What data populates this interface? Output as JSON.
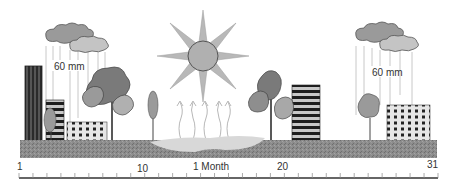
{
  "diagram": {
    "rain_left": {
      "label": "60 mm"
    },
    "rain_right": {
      "label": "60 mm"
    },
    "timeline": {
      "start_label": "1",
      "tick_10_label": "10",
      "center_label": "1 Month",
      "tick_20_label": "20",
      "end_label": "31",
      "start_day": 1,
      "end_day": 31
    },
    "colors": {
      "ground": "#8a8a8a",
      "sun": "#b0b0b0",
      "cloud_dark": "#9a9a9a",
      "cloud_light": "#c4c4c4",
      "tree_dark": "#7a7a7a",
      "tree_light": "#a8a8a8",
      "water": "#d8d8d8",
      "ruler": "#666666"
    }
  }
}
